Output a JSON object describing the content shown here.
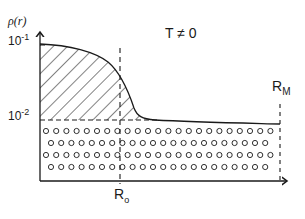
{
  "diagram": {
    "y_axis_label": "ρ(r)",
    "y_ticks": [
      {
        "base": "10",
        "exp": "-1"
      },
      {
        "base": "10",
        "exp": "-2"
      }
    ],
    "condition_label": "T ≠ 0",
    "x_markers": [
      {
        "base": "R",
        "sub": "o"
      },
      {
        "base": "R",
        "sub": "M"
      }
    ],
    "regions": [
      {
        "name": "hatched-region",
        "description": "area under ρ(r) above the 10^-2 level"
      },
      {
        "name": "dotted-region",
        "description": "uniform background density below 10^-2 level up to R_M"
      }
    ],
    "colors": {
      "ink": "#1a1a1a",
      "background": "#ffffff"
    }
  }
}
